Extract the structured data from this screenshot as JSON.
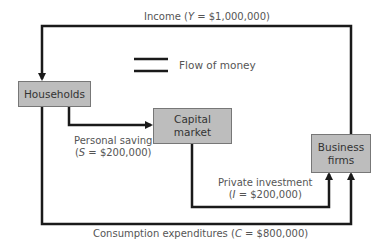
{
  "diagram": {
    "nodes": {
      "households": "Households",
      "capital_market": "Capital\nmarket",
      "business_firms": "Business\nfirms"
    },
    "legend": {
      "label": "Flow of money"
    },
    "flows": {
      "income": {
        "prefix": "Income (",
        "var": "Y",
        "value": " = $1,000,000)"
      },
      "saving": {
        "line1": "Personal saving",
        "prefix": "(",
        "var": "S",
        "value": " = $200,000)"
      },
      "investment": {
        "line1": "Private investment",
        "prefix": "(",
        "var": "I",
        "value": " = $200,000)"
      },
      "consumption": {
        "prefix": "Consumption expenditures (",
        "var": "C",
        "value": " = $800,000)"
      }
    },
    "colors": {
      "box_fill": "#bdbdbd",
      "line": "#1a1a1a",
      "text": "#555555"
    }
  }
}
